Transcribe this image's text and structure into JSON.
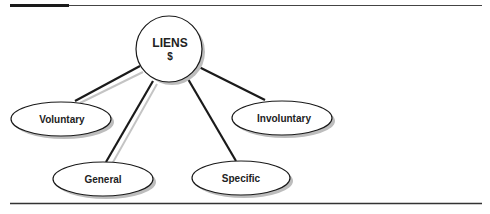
{
  "figure": {
    "header_label": "",
    "header_caption": ""
  },
  "diagram": {
    "center": {
      "title": "LIENS",
      "symbol": "$"
    },
    "nodes": [
      {
        "id": "voluntary",
        "label": "Voluntary"
      },
      {
        "id": "general",
        "label": "General"
      },
      {
        "id": "specific",
        "label": "Specific"
      },
      {
        "id": "involuntary",
        "label": "Involuntary"
      }
    ]
  },
  "colors": {
    "line": "#1a1a1a",
    "shadow": "#b5b5b5",
    "rule": "#333333",
    "fill": "#ffffff"
  }
}
